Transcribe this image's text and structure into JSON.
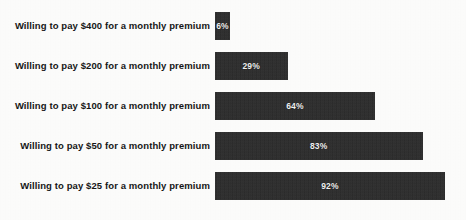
{
  "chart_data": {
    "type": "bar",
    "orientation": "horizontal",
    "title": "",
    "xlabel": "",
    "ylabel": "",
    "grid": false,
    "legend": null,
    "xlim": [
      0,
      100
    ],
    "value_suffix": "%",
    "categories": [
      "Willing to pay $400 for a monthly premium",
      "Willing to pay $200 for a monthly premium",
      "Willing to pay $100 for a monthly premium",
      "Willing to pay $50 for a monthly premium",
      "Willing to pay $25 for a monthly premium"
    ],
    "values": [
      6,
      29,
      64,
      83,
      92
    ],
    "value_labels": [
      "6%",
      "29%",
      "64%",
      "83%",
      "92%"
    ],
    "bar_color": "#2b2b2b",
    "value_label_color": "#f2f2f2",
    "category_label_color": "#161616",
    "background_color": "#fdfdfc"
  },
  "layout": {
    "bar_origin_x": 220,
    "bar_height": 28,
    "row_pitch": 40,
    "first_row_top": 12,
    "px_per_percent": 2.5
  }
}
